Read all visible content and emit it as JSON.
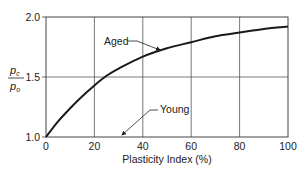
{
  "chart_data": {
    "type": "line",
    "title": "",
    "xlabel": "Plasticity Index (%)",
    "ylabel": "pc / po",
    "ylabel_numerator": "p",
    "ylabel_numerator_sub": "c",
    "ylabel_denominator": "p",
    "ylabel_denominator_sub": "o",
    "xlim": [
      0,
      100
    ],
    "ylim": [
      1.0,
      2.0
    ],
    "x_ticks": [
      0,
      20,
      40,
      60,
      80,
      100
    ],
    "x_tick_labels": [
      "0",
      "20",
      "40",
      "60",
      "80",
      "100"
    ],
    "y_ticks": [
      1.0,
      1.5,
      2.0
    ],
    "y_tick_labels": [
      "1.0",
      "1.5",
      "2.0"
    ],
    "grid": true,
    "series": [
      {
        "name": "Aged",
        "x": [
          0,
          5,
          10,
          15,
          20,
          25,
          30,
          40,
          50,
          60,
          70,
          80,
          90,
          100
        ],
        "values": [
          1.0,
          1.13,
          1.24,
          1.34,
          1.43,
          1.51,
          1.57,
          1.67,
          1.74,
          1.79,
          1.84,
          1.87,
          1.9,
          1.92
        ]
      },
      {
        "name": "Young",
        "x": [
          0,
          100
        ],
        "values": [
          1.0,
          1.0
        ]
      }
    ],
    "annotations": [
      {
        "text": "Aged",
        "points_to_x": 48,
        "points_to_y": 1.71
      },
      {
        "text": "Young",
        "points_to_x": 30,
        "points_to_y": 1.0
      }
    ]
  },
  "colors": {
    "curve": "#1a1a1a",
    "grid": "#555555",
    "text": "#222222"
  }
}
